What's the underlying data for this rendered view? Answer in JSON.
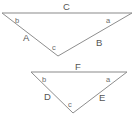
{
  "figure": {
    "background_color": "#ffffff",
    "line_color": "#8e8e8e",
    "text_color": "#5a5a5a"
  },
  "triangles": [
    {
      "id": "upper-triangle",
      "name": "large-triangle",
      "vertices": {
        "top_left": {
          "x": 2,
          "y": 13
        },
        "top_right": {
          "x": 132,
          "y": 13
        },
        "apex": {
          "x": 58,
          "y": 56
        }
      },
      "sides": {
        "top": {
          "label": "C",
          "x": 63,
          "y": 2
        },
        "left": {
          "label": "A",
          "x": 23,
          "y": 33
        },
        "right": {
          "label": "B",
          "x": 96,
          "y": 38
        }
      },
      "angles": {
        "top_left": {
          "label": "b",
          "x": 15,
          "y": 17
        },
        "top_right": {
          "label": "a",
          "x": 106,
          "y": 17
        },
        "apex": {
          "label": "c",
          "x": 52,
          "y": 44
        }
      }
    },
    {
      "id": "lower-triangle",
      "name": "small-triangle",
      "vertices": {
        "top_left": {
          "x": 31,
          "y": 72
        },
        "top_right": {
          "x": 127,
          "y": 72
        },
        "apex": {
          "x": 73,
          "y": 113
        }
      },
      "sides": {
        "top": {
          "label": "F",
          "x": 75,
          "y": 62
        },
        "left": {
          "label": "D",
          "x": 44,
          "y": 92
        },
        "right": {
          "label": "E",
          "x": 99,
          "y": 93
        }
      },
      "angles": {
        "top_left": {
          "label": "b",
          "x": 42,
          "y": 76
        },
        "top_right": {
          "label": "a",
          "x": 106,
          "y": 76
        },
        "apex": {
          "label": "c",
          "x": 68,
          "y": 101
        }
      }
    }
  ]
}
